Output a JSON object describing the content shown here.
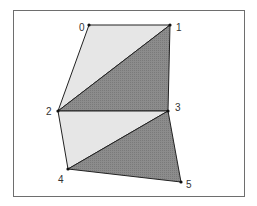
{
  "diagram": {
    "title": "",
    "colors": {
      "light_fill": "#e6e6e6",
      "dark_fill": "#8c8c8c",
      "stroke": "#222222",
      "border": "#6e6e6e"
    },
    "vertices": [
      {
        "id": "0",
        "label": "0",
        "x": 89,
        "y": 25,
        "lx": 79,
        "ly": 31
      },
      {
        "id": "1",
        "label": "1",
        "x": 170,
        "y": 25,
        "lx": 176,
        "ly": 31
      },
      {
        "id": "2",
        "label": "2",
        "x": 58,
        "y": 111,
        "lx": 46,
        "ly": 115
      },
      {
        "id": "3",
        "label": "3",
        "x": 168,
        "y": 111,
        "lx": 175,
        "ly": 111
      },
      {
        "id": "4",
        "label": "4",
        "x": 68,
        "y": 169,
        "lx": 58,
        "ly": 183
      },
      {
        "id": "5",
        "label": "5",
        "x": 181,
        "y": 182,
        "lx": 186,
        "ly": 188
      }
    ],
    "triangles": [
      {
        "vertices": [
          "0",
          "1",
          "2"
        ],
        "shade": "light"
      },
      {
        "vertices": [
          "1",
          "3",
          "2"
        ],
        "shade": "dark"
      },
      {
        "vertices": [
          "2",
          "3",
          "4"
        ],
        "shade": "light"
      },
      {
        "vertices": [
          "3",
          "5",
          "4"
        ],
        "shade": "dark"
      }
    ]
  }
}
